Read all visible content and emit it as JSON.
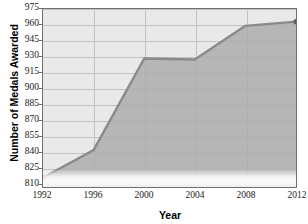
{
  "chart_data": {
    "type": "area",
    "title": "",
    "xlabel": "Year",
    "ylabel": "Number of Medals Awarded",
    "x": [
      1992,
      1996,
      2000,
      2004,
      2008,
      2012
    ],
    "values": [
      815,
      841,
      928,
      927,
      959,
      963
    ],
    "series": [
      {
        "name": "Medals Awarded",
        "values": [
          815,
          841,
          928,
          927,
          959,
          963
        ]
      }
    ],
    "xtick_labels": [
      "1992",
      "1996",
      "2000",
      "2004",
      "2008",
      "2012"
    ],
    "ytick_labels": [
      "810",
      "825",
      "840",
      "855",
      "870",
      "885",
      "900",
      "915",
      "930",
      "945",
      "960",
      "975"
    ],
    "ytick_values": [
      810,
      825,
      840,
      855,
      870,
      885,
      900,
      915,
      930,
      945,
      960,
      975
    ],
    "ylim": [
      806,
      975
    ],
    "xlim": [
      1992,
      2012
    ],
    "grid": true,
    "legend": "none",
    "colors": {
      "area_fill": "#ababab",
      "line": "#8a8a8a",
      "plot_background": "#e9e9e9",
      "gridline": "#c2c2c2",
      "frame": "#6f6f6f",
      "text": "#1a1a1a"
    }
  }
}
